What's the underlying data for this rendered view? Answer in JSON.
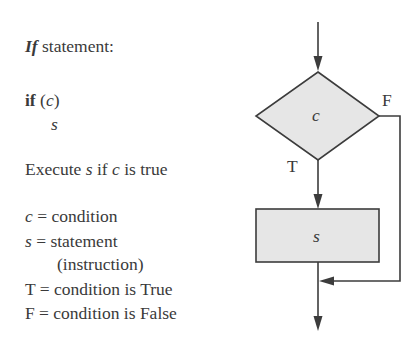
{
  "left_panel": {
    "title_keyword": "If",
    "title_rest": " statement:",
    "code_keyword": "if",
    "code_open": " (",
    "code_cond": "c",
    "code_close": ")",
    "code_body": "s",
    "desc_prefix": "Execute ",
    "desc_s": "s",
    "desc_mid": " if ",
    "desc_c": "c",
    "desc_suffix": " is true",
    "legend": [
      {
        "symbol": "c",
        "text": " = condition"
      },
      {
        "symbol": "s",
        "text": " = statement"
      },
      {
        "symbol": "",
        "text": "(instruction)"
      },
      {
        "symbol": "T",
        "text": " = condition is True"
      },
      {
        "symbol": "F",
        "text": " = condition is False"
      }
    ]
  },
  "flowchart": {
    "decision_label": "c",
    "process_label": "s",
    "true_label": "T",
    "false_label": "F",
    "colors": {
      "stroke": "#3c3c3c",
      "fill": "#e6e6e6"
    }
  }
}
